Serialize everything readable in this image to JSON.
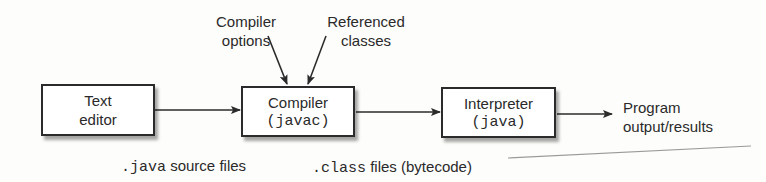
{
  "diagram": {
    "nodes": [
      {
        "id": "editor",
        "line1": "Text",
        "line2": "editor"
      },
      {
        "id": "compiler",
        "line1": "Compiler",
        "line2": "(javac)"
      },
      {
        "id": "interpreter",
        "line1": "Interpreter",
        "line2": "(java)"
      }
    ],
    "inputs": {
      "compiler_options": {
        "line1": "Compiler",
        "line2": "options"
      },
      "referenced_classes": {
        "line1": "Referenced",
        "line2": "classes"
      }
    },
    "output": {
      "line1": "Program",
      "line2": "output/results"
    },
    "edge_labels": {
      "java_code": ".java",
      "java_text": "source files",
      "class_code": ".class",
      "class_text": "files (bytecode)"
    }
  }
}
